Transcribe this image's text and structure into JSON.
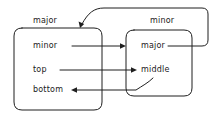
{
  "diagram": {
    "stroke_color": "#1f1f1f",
    "background_color": "#ffffff",
    "boxes": [
      {
        "id": "left",
        "title": "major",
        "rows": [
          {
            "id": "left-row-1",
            "label": "minor"
          },
          {
            "id": "left-row-2",
            "label": "top"
          },
          {
            "id": "left-row-3",
            "label": "bottom"
          }
        ]
      },
      {
        "id": "right",
        "title": "minor",
        "rows": [
          {
            "id": "right-row-1",
            "label": "major"
          },
          {
            "id": "right-row-2",
            "label": "middle"
          }
        ]
      }
    ],
    "edges": [
      {
        "id": "edge-minor-to-major",
        "from": "left.minor",
        "to": "right.major",
        "arrow": "right"
      },
      {
        "id": "edge-top-to-middle",
        "from": "left.top",
        "to": "right.middle",
        "arrow": "right"
      },
      {
        "id": "edge-middle-to-bottom",
        "from": "right.middle",
        "to": "left.bottom",
        "arrow": "left"
      },
      {
        "id": "edge-major-to-left-box",
        "from": "right.major",
        "to": "left.box",
        "arrow": "down-left"
      }
    ]
  }
}
